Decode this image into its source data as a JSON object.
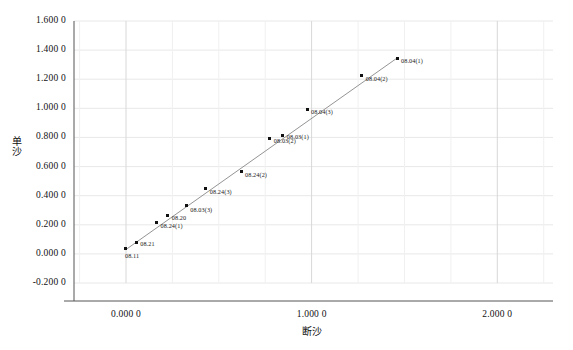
{
  "chart_data": {
    "type": "scatter",
    "title": "",
    "xlabel": "断沙",
    "ylabel": "单沙",
    "xlim": [
      -0.28,
      2.3
    ],
    "ylim": [
      -0.2,
      1.6
    ],
    "grid": true,
    "legend": "none",
    "xticks": [
      "0.000 0",
      "1.000 0",
      "2.000 0"
    ],
    "xtick_values": [
      0.0,
      1.0,
      2.0
    ],
    "yticks": [
      "1.600 0",
      "1.400 0",
      "1.200 0",
      "1.000 0",
      "0.800 0",
      "0.600 0",
      "0.400 0",
      "0.200 0",
      "0.000 0",
      "-0.200 0"
    ],
    "ytick_values": [
      1.6,
      1.4,
      1.2,
      1.0,
      0.8,
      0.6,
      0.4,
      0.2,
      0.0,
      -0.2
    ],
    "points": [
      {
        "label": "08.11",
        "x": 0.0,
        "y": 0.035,
        "label_dx": -1,
        "label_dy": 7
      },
      {
        "label": "08.21",
        "x": 0.055,
        "y": 0.075,
        "label_dx": 4,
        "label_dy": 1
      },
      {
        "label": "08.24(1)",
        "x": 0.165,
        "y": 0.215,
        "label_dx": 4,
        "label_dy": 3
      },
      {
        "label": "08.20",
        "x": 0.225,
        "y": 0.265,
        "label_dx": 4,
        "label_dy": 3
      },
      {
        "label": "08.03(3)",
        "x": 0.325,
        "y": 0.33,
        "label_dx": 4,
        "label_dy": 4
      },
      {
        "label": "08.24(3)",
        "x": 0.43,
        "y": 0.45,
        "label_dx": 4,
        "label_dy": 4
      },
      {
        "label": "08.24(2)",
        "x": 0.62,
        "y": 0.565,
        "label_dx": 4,
        "label_dy": 3
      },
      {
        "label": "08.03(2)",
        "x": 0.775,
        "y": 0.795,
        "label_dx": 4,
        "label_dy": 3
      },
      {
        "label": "08.03(1)",
        "x": 0.845,
        "y": 0.815,
        "label_dx": 4,
        "label_dy": 2
      },
      {
        "label": "08.04(3)",
        "x": 0.975,
        "y": 0.995,
        "label_dx": 4,
        "label_dy": 3
      },
      {
        "label": "08.04(2)",
        "x": 1.27,
        "y": 1.225,
        "label_dx": 4,
        "label_dy": 3
      },
      {
        "label": "08.04(1)",
        "x": 1.46,
        "y": 1.345,
        "label_dx": 4,
        "label_dy": 3
      }
    ],
    "trendline": {
      "x0": 0.0,
      "y0": 0.03,
      "x1": 1.46,
      "y1": 1.345
    },
    "colors": {
      "marker": "#111111",
      "line": "#888888",
      "axis": "#555555",
      "grid": "#e8e8e8",
      "background": "#ffffff"
    }
  }
}
